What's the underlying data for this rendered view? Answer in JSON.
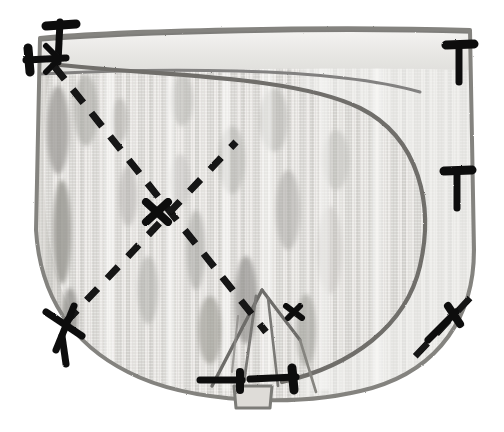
{
  "scene": {
    "title": "Fabric piece with pinned seam and marked fold lines",
    "subject": "sewing-pattern-fabric-panel",
    "width": 504,
    "height": 432,
    "background_color": "#ffffff",
    "rendering": "grayscale photographic illustration"
  },
  "palette": {
    "background": "#ffffff",
    "fabric_light": "#f2f1ef",
    "fabric_mid": "#d8d7d4",
    "fabric_shade": "#b9b8b4",
    "fabric_dark_patch": "#9a9995",
    "fabric_darker_patch": "#87868200",
    "outline_gray": "#8d8c89",
    "outline_dark": "#6e6d6a",
    "marking_black": "#111111",
    "hem_band": "#e6e5e2"
  },
  "shapes": {
    "main_panel": {
      "name": "fabric-panel",
      "description": "Large rounded-bottom rectangular fabric panel occupying most of the frame",
      "bounds": {
        "x": 34,
        "y": 26,
        "width": 440,
        "height": 370
      }
    },
    "hem_band": {
      "name": "top-hem-band",
      "description": "Narrow horizontal stitched hem band across the top edge",
      "y_top": 34,
      "y_bottom": 72
    },
    "inner_flap": {
      "name": "inner-curved-flap",
      "description": "Large tongue/leaf shaped inner seam curving from top-left down to bottom-center-right",
      "tip": {
        "x": 52,
        "y": 62
      }
    },
    "bottom_tab": {
      "name": "bottom-center-tab",
      "description": "Small rectangular tab protruding below the bottom edge at center",
      "x": 232,
      "y": 388,
      "width": 40,
      "height": 22
    },
    "center_dart": {
      "name": "center-dart-fold",
      "description": "Narrow pointed dart/pleat folded in the lower center of the panel",
      "apex": {
        "x": 262,
        "y": 290
      }
    }
  },
  "markings": {
    "dashed_lines": [
      {
        "name": "primary-diagonal-fold-line",
        "description": "Long dashed fold line from upper-left corner to lower-center",
        "from": {
          "x": 54,
          "y": 66
        },
        "to": {
          "x": 266,
          "y": 330
        }
      },
      {
        "name": "secondary-diagonal-fold-line",
        "description": "Dashed fold line from lower-left cross mark up to center crossing point",
        "from": {
          "x": 66,
          "y": 320
        },
        "to": {
          "x": 230,
          "y": 150
        }
      },
      {
        "name": "bottom-right-fold-line",
        "description": "Short dashed line along the lower-right curved edge",
        "from": {
          "x": 468,
          "y": 300
        },
        "to": {
          "x": 410,
          "y": 362
        }
      }
    ],
    "pins": [
      {
        "name": "pin-top-left-vertical",
        "x": 58,
        "y": 24,
        "angle": 92,
        "length": 40
      },
      {
        "name": "pin-top-left-horizontal",
        "x": 30,
        "y": 60,
        "angle": 8,
        "length": 38
      },
      {
        "name": "pin-right-upper",
        "x": 458,
        "y": 44,
        "angle": 90,
        "length": 38
      },
      {
        "name": "pin-right-upper-dash",
        "x": 460,
        "y": 92,
        "angle": 90,
        "length": 26
      },
      {
        "name": "pin-right-lower",
        "x": 456,
        "y": 170,
        "angle": 90,
        "length": 38
      },
      {
        "name": "pin-right-lower-dash",
        "x": 458,
        "y": 218,
        "angle": 90,
        "length": 26
      },
      {
        "name": "pin-bottom-left-cross",
        "x": 62,
        "y": 322,
        "angle": 60,
        "length": 44
      },
      {
        "name": "pin-bottom-center-left",
        "x": 218,
        "y": 382,
        "angle": 0,
        "length": 40
      },
      {
        "name": "pin-bottom-center-right",
        "x": 268,
        "y": 380,
        "angle": 2,
        "length": 42
      },
      {
        "name": "pin-bottom-right-angled",
        "x": 448,
        "y": 318,
        "angle": 125,
        "length": 36
      },
      {
        "name": "pin-center-dart-marker",
        "x": 286,
        "y": 310,
        "angle": 40,
        "length": 26
      }
    ],
    "cross_marks": [
      {
        "name": "cross-mark-center",
        "x": 156,
        "y": 212,
        "size": 26
      },
      {
        "name": "cross-mark-bottom-left",
        "x": 64,
        "y": 324,
        "size": 30
      }
    ]
  },
  "texture": {
    "name": "vertical-striated-fabric-weave",
    "stripe_orientation": "vertical",
    "stripe_count": 22,
    "mottle_patch_count": 18
  },
  "labels": {
    "alt_text": "Grayscale illustration of a fabric panel pinned along its edges with dashed fold lines marked across the surface"
  }
}
